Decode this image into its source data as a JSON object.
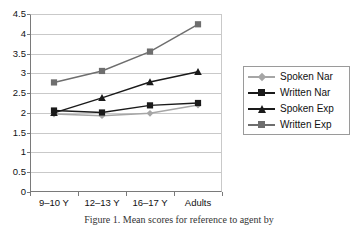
{
  "chart_data": {
    "type": "line",
    "title": "",
    "xlabel": "",
    "ylabel": "",
    "categories": [
      "9–10 Y",
      "12–13 Y",
      "16–17 Y",
      "Adults"
    ],
    "ylim": [
      0,
      4.5
    ],
    "yticks": [
      "0",
      "0.5",
      "1",
      "1.5",
      "2",
      "2.5",
      "3",
      "3.5",
      "4",
      "4.5"
    ],
    "ytick_values": [
      0,
      0.5,
      1,
      1.5,
      2,
      2.5,
      3,
      3.5,
      4,
      4.5
    ],
    "grid": "horizontal",
    "legend_position": "right",
    "series": [
      {
        "name": "Spoken Nar",
        "marker": "diamond",
        "color": "#a6a6a6",
        "values": [
          1.97,
          1.93,
          1.99,
          2.2
        ]
      },
      {
        "name": "Written Nar",
        "marker": "square",
        "color": "#1a1a1a",
        "values": [
          2.06,
          2.01,
          2.19,
          2.25
        ]
      },
      {
        "name": "Spoken Exp",
        "marker": "triangle",
        "color": "#1a1a1a",
        "values": [
          2.0,
          2.38,
          2.78,
          3.04
        ]
      },
      {
        "name": "Written Exp",
        "marker": "square",
        "color": "#6e6e6e",
        "values": [
          2.77,
          3.06,
          3.55,
          4.24
        ]
      }
    ]
  },
  "legend": {
    "items": [
      {
        "label": "Spoken Nar"
      },
      {
        "label": "Written Nar"
      },
      {
        "label": "Spoken Exp"
      },
      {
        "label": "Written Exp"
      }
    ]
  },
  "caption": {
    "text": "Figure 1. Mean scores for reference to agent by"
  }
}
